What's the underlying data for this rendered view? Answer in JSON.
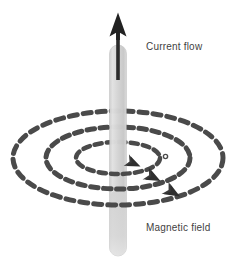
{
  "figure": {
    "background_color": "#ffffff",
    "width": 243,
    "height": 267
  },
  "labels": {
    "current_flow": "Current flow",
    "magnetic_field": "Magnetic field"
  },
  "colors": {
    "text": "#3f3f3f",
    "conductor_fill": "#d7d7d7",
    "conductor_edge": "#bdbdbd",
    "arrow_dark": "#262626",
    "field_line": "#4a4a4a"
  },
  "diagram_data": {
    "type": "physics-diagram",
    "conductor": {
      "name": "current-carrying conductor",
      "orientation": "vertical",
      "center_x": 118,
      "top_y": 45,
      "bottom_y": 256,
      "width": 17,
      "fill": "#d7d7d7"
    },
    "current_arrow": {
      "name": "current-flow-arrow",
      "direction": "up",
      "tip_x": 118,
      "tip_y": 13,
      "tail_y": 78,
      "color": "#262626",
      "label": "Current flow"
    },
    "field_lines": {
      "name": "magnetic-field-lines",
      "shape": "concentric dashed ellipses",
      "count": 3,
      "center_x": 118,
      "center_y": 158,
      "dash_pattern": "7 5",
      "color": "#4a4a4a",
      "rings": [
        {
          "rx": 105,
          "ry": 47,
          "stroke_width": 5,
          "arrow_angle_deg": 28
        },
        {
          "rx": 72,
          "ry": 31,
          "stroke_width": 5,
          "arrow_angle_deg": 24
        },
        {
          "rx": 42,
          "ry": 16,
          "stroke_width": 4.5,
          "arrow_angle_deg": 20
        }
      ],
      "circulation": "clockwise viewed from above (right-hand rule)",
      "label": "Magnetic field"
    }
  }
}
